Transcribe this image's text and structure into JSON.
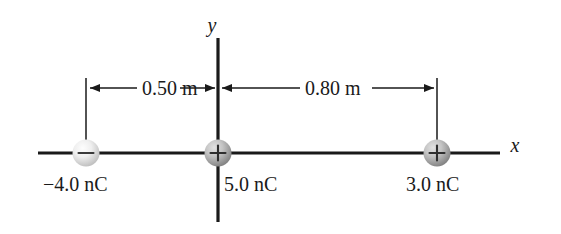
{
  "figure": {
    "background_color": "#ffffff",
    "line_color": "#1a1a1a",
    "axes": {
      "x_label": "x",
      "y_label": "y"
    },
    "dimensions": [
      {
        "id": "left-span",
        "label": "0.50 m",
        "value": 0.5,
        "unit": "m",
        "from": "-4.0 nC",
        "to": "5.0 nC"
      },
      {
        "id": "right-span",
        "label": "0.80 m",
        "value": 0.8,
        "unit": "m",
        "from": "5.0 nC",
        "to": "3.0 nC"
      }
    ],
    "charges": [
      {
        "id": "charge-left",
        "label": "−4.0 nC",
        "value": -4.0,
        "unit": "nC",
        "sign": "−",
        "sign_name": "minus",
        "position_m": -0.5,
        "sphere_fill_light": "#f2f2f2",
        "sphere_fill_dark": "#b9b9b9"
      },
      {
        "id": "charge-center",
        "label": "5.0 nC",
        "value": 5.0,
        "unit": "nC",
        "sign": "+",
        "sign_name": "plus",
        "position_m": 0.0,
        "sphere_fill_light": "#d8d8d8",
        "sphere_fill_dark": "#8a8a8a"
      },
      {
        "id": "charge-right",
        "label": "3.0 nC",
        "value": 3.0,
        "unit": "nC",
        "sign": "+",
        "sign_name": "plus",
        "position_m": 0.8,
        "sphere_fill_light": "#d8d8d8",
        "sphere_fill_dark": "#8a8a8a"
      }
    ]
  }
}
